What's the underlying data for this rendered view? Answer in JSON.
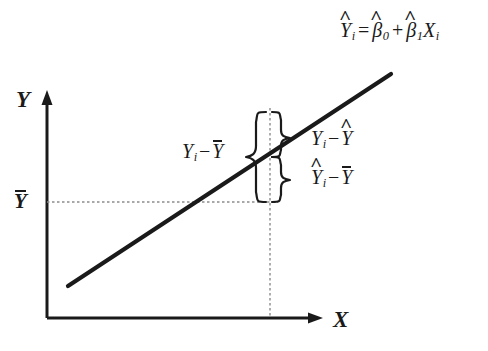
{
  "diagram": {
    "background_color": "#ffffff",
    "ink_color": "#1a1a1a",
    "guide_color": "#8c8c8c"
  },
  "axes": {
    "y_label": "Y",
    "x_label": "X",
    "origin": {
      "x": 47,
      "y": 318
    },
    "y_top": {
      "x": 47,
      "y": 92
    },
    "x_right": {
      "x": 322,
      "y": 318
    }
  },
  "regression_line": {
    "equation_parts": {
      "lhs_var": "Y",
      "lhs_sub": "i",
      "equals": "=",
      "intercept_var": "β",
      "intercept_sub": "0",
      "plus": "+",
      "slope_var": "β",
      "slope_sub": "1",
      "x_var": "X",
      "x_sub": "i"
    },
    "equation_text": "Ŷi = β̅0 + β̅1Xi",
    "start": {
      "x": 68,
      "y": 286
    },
    "end": {
      "x": 391,
      "y": 74
    }
  },
  "mean_line": {
    "label_var": "Y",
    "label_text": "Ȳ",
    "y": 202
  },
  "observation": {
    "x_position": 270
  },
  "deviations": {
    "total": {
      "var": "Y",
      "sub": "i",
      "minus": "−",
      "ref": "Y",
      "text": "Yi − Ȳ",
      "meaning": "total-deviation"
    },
    "residual": {
      "var": "Y",
      "sub": "i",
      "minus": "−",
      "ref": "Y",
      "text": "Yi − Ŷ",
      "meaning": "unexplained-residual"
    },
    "explained": {
      "var": "Y",
      "sub": "i",
      "minus": "−",
      "ref": "Y",
      "text": "Ŷi − Ȳ",
      "meaning": "explained-deviation"
    }
  }
}
